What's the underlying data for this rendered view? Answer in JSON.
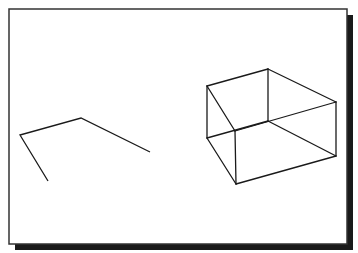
{
  "diagram": {
    "frame": {
      "x": 9,
      "y": 9,
      "width": 338,
      "height": 235,
      "stroke": "#333333",
      "shadow_color": "#1a1a1a",
      "shadow_offset": 6
    },
    "line_color": "#1a1a1a",
    "polyline": {
      "label": "open-polyline",
      "points": [
        [
          48,
          181
        ],
        [
          20,
          135
        ],
        [
          81,
          118
        ],
        [
          150,
          152
        ]
      ]
    },
    "box": {
      "label": "wireframe-box",
      "vertices": {
        "top_left": [
          207,
          86
        ],
        "top_back": [
          268,
          69
        ],
        "top_right": [
          336,
          102
        ],
        "top_front": [
          235,
          131
        ],
        "bottom_left": [
          207,
          138
        ],
        "bottom_back": [
          268,
          121
        ],
        "bottom_right": [
          336,
          156
        ],
        "bottom_front": [
          236,
          184
        ]
      },
      "edges": [
        [
          "top_left",
          "top_back"
        ],
        [
          "top_back",
          "top_right"
        ],
        [
          "top_right",
          "top_front"
        ],
        [
          "top_front",
          "top_left"
        ],
        [
          "bottom_left",
          "bottom_back"
        ],
        [
          "bottom_back",
          "bottom_right"
        ],
        [
          "bottom_right",
          "bottom_front"
        ],
        [
          "bottom_front",
          "bottom_left"
        ],
        [
          "top_left",
          "bottom_left"
        ],
        [
          "top_back",
          "bottom_back"
        ],
        [
          "top_right",
          "bottom_right"
        ],
        [
          "top_front",
          "bottom_front"
        ]
      ]
    }
  }
}
